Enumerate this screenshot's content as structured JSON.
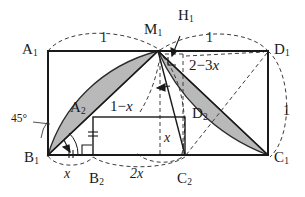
{
  "figure": {
    "width": 305,
    "height": 197,
    "colors": {
      "stroke": "#1a1a1a",
      "shaded_fill": "#b9b9b9",
      "shaded_stroke": "#2b2b2b",
      "dashed": "#3c3c3c",
      "background": "#ffffff"
    },
    "vertices": {
      "A1": {
        "label": "A",
        "sub": "1",
        "x": 48,
        "y": 51
      },
      "D1": {
        "label": "D",
        "sub": "1",
        "x": 268,
        "y": 51
      },
      "B1": {
        "label": "B",
        "sub": "1",
        "x": 48,
        "y": 155
      },
      "C1": {
        "label": "C",
        "sub": "1",
        "x": 268,
        "y": 155
      },
      "M1": {
        "label": "M",
        "sub": "1",
        "x": 158,
        "y": 51
      },
      "H1": {
        "label": "H",
        "sub": "1",
        "x": 184,
        "y": 51
      },
      "A2": {
        "label": "A",
        "sub": "2",
        "x": 93,
        "y": 117
      },
      "B2": {
        "label": "B",
        "sub": "2",
        "x": 93,
        "y": 155
      },
      "C2": {
        "label": "C",
        "sub": "2",
        "x": 185,
        "y": 155
      },
      "D2": {
        "label": "D",
        "sub": "2",
        "x": 185,
        "y": 117
      }
    },
    "point_labels": [
      {
        "name": "vertex-label-a1",
        "text": "A",
        "sub": "1",
        "x": 22,
        "y": 42
      },
      {
        "name": "vertex-label-d1",
        "text": "D",
        "sub": "1",
        "x": 274,
        "y": 42
      },
      {
        "name": "vertex-label-b1",
        "text": "B",
        "sub": "1",
        "x": 24,
        "y": 150
      },
      {
        "name": "vertex-label-c1",
        "text": "C",
        "sub": "1",
        "x": 274,
        "y": 150
      },
      {
        "name": "vertex-label-m1",
        "text": "M",
        "sub": "1",
        "x": 144,
        "y": 22
      },
      {
        "name": "vertex-label-h1",
        "text": "H",
        "sub": "1",
        "x": 178,
        "y": 8
      },
      {
        "name": "vertex-label-a2",
        "text": "A",
        "sub": "2",
        "x": 70,
        "y": 100
      },
      {
        "name": "vertex-label-b2",
        "text": "B",
        "sub": "2",
        "x": 89,
        "y": 171
      },
      {
        "name": "vertex-label-c2",
        "text": "C",
        "sub": "2",
        "x": 177,
        "y": 171
      },
      {
        "name": "vertex-label-d2",
        "text": "D",
        "sub": "2",
        "x": 192,
        "y": 106
      }
    ],
    "measure_labels": [
      {
        "name": "length-label-top-left",
        "kind": "num",
        "text": "1",
        "x": 100,
        "y": 31
      },
      {
        "name": "length-label-top-right",
        "kind": "num",
        "text": "1",
        "x": 206,
        "y": 31
      },
      {
        "name": "length-label-right-side",
        "kind": "num",
        "text": "1",
        "x": 283,
        "y": 104
      },
      {
        "name": "length-label-bottom-x",
        "kind": "len",
        "text": "x",
        "x": 64,
        "y": 167
      },
      {
        "name": "length-label-bottom-2x",
        "kind": "len",
        "text": "2x",
        "x": 130,
        "y": 167
      },
      {
        "name": "length-label-inner-x",
        "kind": "len",
        "text": "x",
        "x": 164,
        "y": 131
      },
      {
        "name": "angle-label-45",
        "kind": "ang",
        "text": "45°",
        "x": 11,
        "y": 113
      }
    ],
    "expressions": [
      {
        "name": "expression-2-minus-3x",
        "pre": "2",
        "minus": "−",
        "coef": "3",
        "varname": "x",
        "x": 189,
        "y": 58
      },
      {
        "name": "expression-1-minus-x",
        "pre": "1",
        "minus": "−",
        "coef": "",
        "varname": "x",
        "x": 110,
        "y": 99
      }
    ],
    "geometry": {
      "outer_rect": {
        "x": 48,
        "y": 51,
        "w": 220,
        "h": 104
      },
      "inner_rect": {
        "x": 93,
        "y": 117,
        "w": 92,
        "h": 38
      },
      "shaded_region_left": "crescent between arc B1-M1 and segment B1-M1",
      "shaded_region_right": "crescent between arc M1-C1 and segment M1-C1",
      "solid_lines": [
        "B1-M1 diagonal",
        "M1-C1 chord",
        "M1-C2 segment",
        "inner rectangle A2 B2 C2 D2"
      ],
      "dashed_lines": [
        "arc A1 over top-left labelled 1",
        "arc over top-right labelled 1",
        "arc right of D1C1 labelled 1",
        "arc below B1-B2 labelled x",
        "arc below B2-C2 labelled 2x",
        "M1-H1 horizontal",
        "M1 vertical drop",
        "H1 vertical drop",
        "M1-C1 dashed diagonal to D1",
        "circle arc through M1 and C2"
      ],
      "tick_marks": [
        "double tick on B1-B2 segment",
        "double tick on A2-B2 segment",
        "right angle at B2",
        "right angle under M1"
      ]
    }
  }
}
